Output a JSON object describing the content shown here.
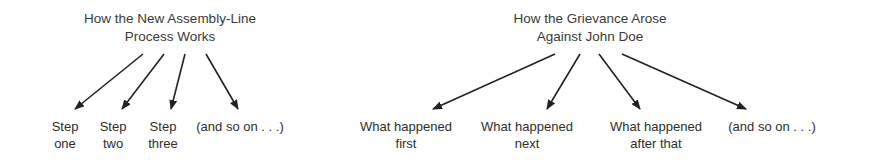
{
  "diagrams": [
    {
      "title_line1": "How the New Assembly-Line",
      "title_line2": "Process Works",
      "labels": [
        {
          "line1": "Step",
          "line2": "one"
        },
        {
          "line1": "Step",
          "line2": "two"
        },
        {
          "line1": "Step",
          "line2": "three"
        },
        {
          "line1": "(and so on . . .)",
          "line2": ""
        }
      ]
    },
    {
      "title_line1": "How the Grievance Arose",
      "title_line2": "Against John Doe",
      "labels": [
        {
          "line1": "What happened",
          "line2": "first"
        },
        {
          "line1": "What happened",
          "line2": "next"
        },
        {
          "line1": "What happened",
          "line2": "after that"
        },
        {
          "line1": "(and so on . . .)",
          "line2": ""
        }
      ]
    }
  ],
  "colors": {
    "arrow": "#222222",
    "text": "#333333",
    "background": "#ffffff"
  }
}
